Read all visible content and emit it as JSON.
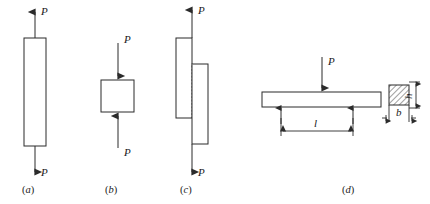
{
  "figure": {
    "title": "",
    "background_color": "#ffffff",
    "line_color": "#2b2b2b",
    "dashed_color": "#9a9a9a",
    "panels": [
      {
        "id": "a",
        "label": "(a)",
        "caption_text": "a",
        "type": "axial-tension-bar",
        "force_labels": [
          "P",
          "P"
        ],
        "force_directions": [
          "up",
          "down"
        ]
      },
      {
        "id": "b",
        "label": "(b)",
        "caption_text": "b",
        "type": "axial-compression-block",
        "force_labels": [
          "P",
          "P"
        ],
        "force_directions": [
          "down",
          "up"
        ]
      },
      {
        "id": "c",
        "label": "(c)",
        "caption_text": "c",
        "type": "lap-joint-shear",
        "force_labels": [
          "P",
          "P"
        ],
        "force_directions": [
          "up",
          "down"
        ]
      },
      {
        "id": "d",
        "label": "(d)",
        "caption_text": "d",
        "type": "simply-supported-beam",
        "force_labels": [
          "P"
        ],
        "force_directions": [
          "down"
        ],
        "dimensions": [
          {
            "symbol": "l",
            "meaning": "span length"
          },
          {
            "symbol": "b",
            "meaning": "section width"
          },
          {
            "symbol": "h",
            "meaning": "section height"
          }
        ]
      }
    ],
    "symbols": {
      "force": "P",
      "span": "l",
      "width": "b",
      "height": "h"
    }
  }
}
